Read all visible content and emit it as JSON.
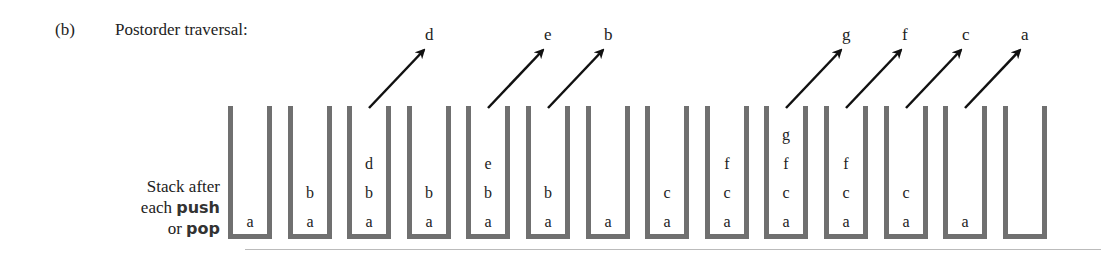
{
  "figure": {
    "part_label": "(b)",
    "title": "Postorder traversal:",
    "side_label": {
      "line1": "Stack after",
      "line2_text": "each",
      "line2_code": "push",
      "line3_text": "or",
      "line3_code": "pop"
    },
    "stacks": [
      {
        "contents_bottom_to_top": [
          "a"
        ],
        "popped": null
      },
      {
        "contents_bottom_to_top": [
          "a",
          "b"
        ],
        "popped": null
      },
      {
        "contents_bottom_to_top": [
          "a",
          "b",
          "d"
        ],
        "popped": "d"
      },
      {
        "contents_bottom_to_top": [
          "a",
          "b"
        ],
        "popped": null
      },
      {
        "contents_bottom_to_top": [
          "a",
          "b",
          "e"
        ],
        "popped": "e"
      },
      {
        "contents_bottom_to_top": [
          "a",
          "b"
        ],
        "popped": "b"
      },
      {
        "contents_bottom_to_top": [
          "a"
        ],
        "popped": null
      },
      {
        "contents_bottom_to_top": [
          "a",
          "c"
        ],
        "popped": null
      },
      {
        "contents_bottom_to_top": [
          "a",
          "c",
          "f"
        ],
        "popped": null
      },
      {
        "contents_bottom_to_top": [
          "a",
          "c",
          "f",
          "g"
        ],
        "popped": "g"
      },
      {
        "contents_bottom_to_top": [
          "a",
          "c",
          "f"
        ],
        "popped": "f"
      },
      {
        "contents_bottom_to_top": [
          "a",
          "c"
        ],
        "popped": "c"
      },
      {
        "contents_bottom_to_top": [
          "a"
        ],
        "popped": "a"
      },
      {
        "contents_bottom_to_top": [],
        "popped": null
      }
    ],
    "postorder_output": [
      "d",
      "e",
      "b",
      "g",
      "f",
      "c",
      "a"
    ],
    "colors": {
      "stack_wall": "#707070",
      "arrow": "#111111",
      "rule": "#bbbbbb"
    }
  }
}
